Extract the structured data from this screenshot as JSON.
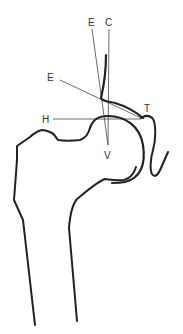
{
  "diagram": {
    "type": "anatomical-line-drawing",
    "labels": {
      "e_top": "E",
      "c_top": "C",
      "e_left": "E",
      "h_left": "H",
      "t_right": "T",
      "v_center": "V"
    },
    "colors": {
      "outline": "#222222",
      "thin_line": "#444444",
      "text": "#333333",
      "background": "#ffffff"
    }
  }
}
